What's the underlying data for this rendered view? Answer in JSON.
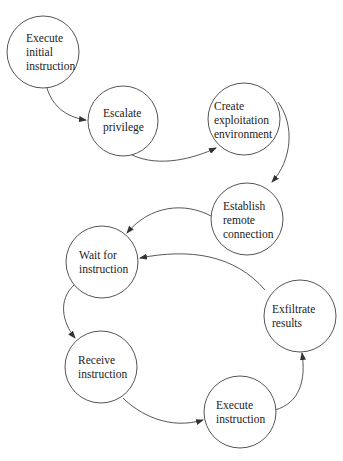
{
  "diagram": {
    "type": "state-flow",
    "nodes": [
      {
        "id": "n1",
        "lines": [
          "Execute",
          "initial",
          "instruction"
        ]
      },
      {
        "id": "n2",
        "lines": [
          "Escalate",
          "privilege"
        ]
      },
      {
        "id": "n3",
        "lines": [
          "Create",
          "exploitation",
          "environment"
        ]
      },
      {
        "id": "n4",
        "lines": [
          "Establish",
          "remote",
          "connection"
        ]
      },
      {
        "id": "n5",
        "lines": [
          "Wait for",
          "instruction"
        ]
      },
      {
        "id": "n6",
        "lines": [
          "Receive",
          "instruction"
        ]
      },
      {
        "id": "n7",
        "lines": [
          "Execute",
          "instruction"
        ]
      },
      {
        "id": "n8",
        "lines": [
          "Exfiltrate",
          "results"
        ]
      }
    ],
    "edges": [
      {
        "from": "n1",
        "to": "n2"
      },
      {
        "from": "n2",
        "to": "n3"
      },
      {
        "from": "n3",
        "to": "n4"
      },
      {
        "from": "n4",
        "to": "n5"
      },
      {
        "from": "n5",
        "to": "n6"
      },
      {
        "from": "n6",
        "to": "n7"
      },
      {
        "from": "n7",
        "to": "n8"
      },
      {
        "from": "n8",
        "to": "n5"
      }
    ]
  }
}
